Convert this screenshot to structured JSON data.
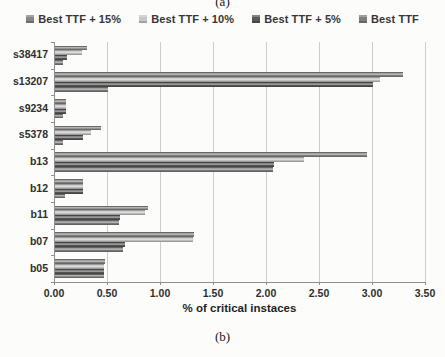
{
  "figure_labels": {
    "top": "(a)",
    "bottom": "(b)"
  },
  "chart_data": {
    "type": "bar",
    "orientation": "horizontal",
    "title": "",
    "xlabel": "% of critical instaces",
    "ylabel": "",
    "xlim": [
      0,
      3.5
    ],
    "xtick_step": 0.5,
    "xticks": [
      "0.00",
      "0.50",
      "1.00",
      "1.50",
      "2.00",
      "2.50",
      "3.00",
      "3.50"
    ],
    "grid": "vertical",
    "legend_position": "top",
    "categories": [
      "s38417",
      "s13207",
      "s9234",
      "s5378",
      "b13",
      "b12",
      "b11",
      "b07",
      "b05"
    ],
    "series": [
      {
        "name": "Best TTF + 15%",
        "color": "#868686",
        "values": [
          0.3,
          3.28,
          0.1,
          0.43,
          2.94,
          0.26,
          0.88,
          1.31,
          0.47
        ]
      },
      {
        "name": "Best TTF + 10%",
        "color": "#c7c7c7",
        "values": [
          0.25,
          3.07,
          0.1,
          0.34,
          2.35,
          0.26,
          0.85,
          1.3,
          0.46
        ]
      },
      {
        "name": "Best TTF + 5%",
        "color": "#585858",
        "values": [
          0.11,
          3.0,
          0.1,
          0.26,
          2.07,
          0.26,
          0.61,
          0.66,
          0.46
        ]
      },
      {
        "name": "Best TTF",
        "color": "#7e7e7e",
        "values": [
          0.08,
          0.5,
          0.08,
          0.08,
          2.06,
          0.09,
          0.6,
          0.64,
          0.46
        ]
      }
    ]
  }
}
